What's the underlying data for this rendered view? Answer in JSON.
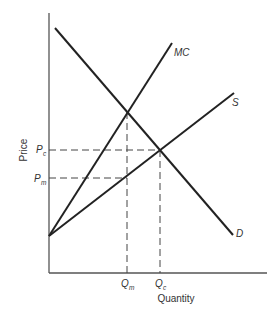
{
  "diagram": {
    "type": "monopsony-vs-competition",
    "axes": {
      "y_label": "Price",
      "x_label": "Quantity"
    },
    "curves": {
      "demand": {
        "label": "D"
      },
      "marginal_cost": {
        "label": "MC"
      },
      "supply": {
        "label": "S"
      }
    },
    "price_ticks": [
      {
        "main": "P",
        "sub": "c"
      },
      {
        "main": "P",
        "sub": "m"
      }
    ],
    "quantity_ticks": [
      {
        "main": "Q",
        "sub": "m"
      },
      {
        "main": "Q",
        "sub": "c"
      }
    ]
  }
}
